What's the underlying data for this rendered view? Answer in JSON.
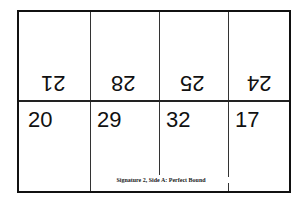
{
  "diagram": {
    "title": "Signature 2, Side A: Perfect Bound",
    "top_row": {
      "orientation": "upside-down",
      "pages": [
        "21",
        "28",
        "25",
        "24"
      ]
    },
    "bottom_row": {
      "orientation": "upright",
      "pages": [
        "20",
        "29",
        "32",
        "17"
      ]
    }
  }
}
